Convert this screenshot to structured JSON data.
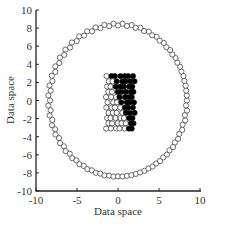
{
  "chart_data": {
    "type": "scatter",
    "title": "",
    "xlabel": "Data space",
    "ylabel": "Data space",
    "xlim": [
      -10,
      10
    ],
    "ylim": [
      -10,
      10
    ],
    "xticks": [
      -10,
      -5,
      0,
      5,
      10
    ],
    "yticks": [
      -10,
      -8,
      -6,
      -4,
      -2,
      0,
      2,
      4,
      6,
      8,
      10
    ],
    "grid": false,
    "legend": null,
    "series": [
      {
        "name": "outer ring (open circles)",
        "marker": "open-circle",
        "color": "#ffffff",
        "edge_color": "#333333",
        "shape": "circle",
        "center": [
          0,
          0
        ],
        "radius": 8.4,
        "n_points": 96
      },
      {
        "name": "inner cluster class A (open circles)",
        "marker": "open-circle",
        "color": "#ffffff",
        "edge_color": "#333333",
        "region": "lower-left of inner grid",
        "x_range": [
          -1.5,
          1.8
        ],
        "y_range": [
          -3.3,
          2.8
        ]
      },
      {
        "name": "inner cluster class B (filled circles)",
        "marker": "filled-circle",
        "color": "#000000",
        "region": "upper-right of inner grid",
        "x_range": [
          -1.0,
          1.8
        ],
        "y_range": [
          -3.3,
          2.8
        ]
      }
    ]
  },
  "axes": {
    "x_label": "Data space",
    "y_label": "Data space",
    "x_tick_labels": [
      "-10",
      "-5",
      "0",
      "5",
      "10"
    ],
    "y_tick_labels": [
      "10",
      "8",
      "6",
      "4",
      "2",
      "0",
      "-2",
      "-4",
      "-6",
      "-8",
      "-10"
    ]
  },
  "colors": {
    "axis": "#222222",
    "open_marker_edge": "#444444",
    "filled_marker": "#000000",
    "background": "#ffffff"
  }
}
